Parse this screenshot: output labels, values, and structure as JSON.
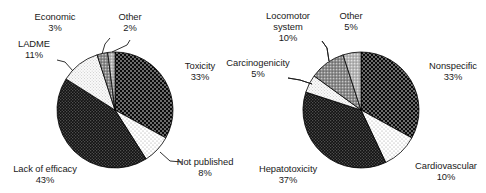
{
  "figure": {
    "background": "#ffffff",
    "width": 486,
    "height": 193
  },
  "chart_data": [
    {
      "type": "pie",
      "id": "reasons-for-attrition",
      "title": "",
      "position": "left",
      "unit": "%",
      "start_angle_deg": 0,
      "direction": "clockwise",
      "center": [
        115,
        110
      ],
      "radius": 58,
      "legend": "none",
      "labels_position": "outside-with-leader-lines",
      "categories": [
        "Toxicity",
        "Not published",
        "Lack of efficacy",
        "LADME",
        "Economic",
        "Other"
      ],
      "values": [
        33,
        8,
        43,
        11,
        3,
        2
      ],
      "slices": [
        {
          "label": "Toxicity",
          "value": 33,
          "pct_text": "33%",
          "fill": "#0a0a0a",
          "pattern": "black-white-dots"
        },
        {
          "label": "Not published",
          "value": 8,
          "pct_text": "8%",
          "fill": "#fdfdfd",
          "pattern": "white-sparse-dots"
        },
        {
          "label": "Lack of efficacy",
          "value": 43,
          "pct_text": "43%",
          "fill": "#151515",
          "pattern": "dark-crosshatch"
        },
        {
          "label": "LADME",
          "value": 11,
          "pct_text": "11%",
          "fill": "#f2f2f2",
          "pattern": "very-light-dots"
        },
        {
          "label": "Economic",
          "value": 3,
          "pct_text": "3%",
          "fill": "#808080",
          "pattern": "mid-gray"
        },
        {
          "label": "Other",
          "value": 2,
          "pct_text": "2%",
          "fill": "#b0b0b0",
          "pattern": "light-gray"
        }
      ]
    },
    {
      "type": "pie",
      "id": "toxicity-breakdown",
      "title": "",
      "position": "right",
      "unit": "%",
      "start_angle_deg": 0,
      "direction": "clockwise",
      "center": [
        118,
        110
      ],
      "radius": 58,
      "legend": "none",
      "labels_position": "outside-with-leader-lines",
      "categories": [
        "Nonspecific",
        "Cardiovascular",
        "Hepatotoxicity",
        "Carcinogenicity",
        "Locomotor system",
        "Other"
      ],
      "values": [
        33,
        10,
        37,
        5,
        10,
        5
      ],
      "slices": [
        {
          "label": "Nonspecific",
          "value": 33,
          "pct_text": "33%",
          "fill": "#0a0a0a",
          "pattern": "black-white-dots"
        },
        {
          "label": "Cardiovascular",
          "value": 10,
          "pct_text": "10%",
          "fill": "#fdfdfd",
          "pattern": "white-sparse-dots"
        },
        {
          "label": "Hepatotoxicity",
          "value": 37,
          "pct_text": "37%",
          "fill": "#151515",
          "pattern": "dark-crosshatch"
        },
        {
          "label": "Carcinogenicity",
          "value": 5,
          "pct_text": "5%",
          "fill": "#f2f2f2",
          "pattern": "very-light-dots"
        },
        {
          "label": "Locomotor system",
          "value": 10,
          "pct_text": "10%",
          "fill": "#808080",
          "pattern": "mid-gray"
        },
        {
          "label": "Other",
          "value": 5,
          "pct_text": "5%",
          "fill": "#b0b0b0",
          "pattern": "light-gray"
        }
      ]
    }
  ],
  "left_chart": {
    "labels": {
      "economic": {
        "name": "Economic",
        "pct": "3%"
      },
      "other": {
        "name": "Other",
        "pct": "2%"
      },
      "ladme": {
        "name": "LADME",
        "pct": "11%"
      },
      "toxicity": {
        "name": "Toxicity",
        "pct": "33%"
      },
      "not_published": {
        "name": "Not published",
        "pct": "8%"
      },
      "lack": {
        "name": "Lack of efficacy",
        "pct": "43%"
      }
    }
  },
  "right_chart": {
    "labels": {
      "locomotor": {
        "name_line1": "Locomotor",
        "name_line2": "system",
        "pct": "10%"
      },
      "other": {
        "name": "Other",
        "pct": "5%"
      },
      "carcinogenicity": {
        "name": "Carcinogenicity",
        "pct": "5%"
      },
      "nonspecific": {
        "name": "Nonspecific",
        "pct": "33%"
      },
      "cardiovascular": {
        "name": "Cardiovascular",
        "pct": "10%"
      },
      "hepatotoxicity": {
        "name": "Hepatotoxicity",
        "pct": "37%"
      }
    }
  }
}
